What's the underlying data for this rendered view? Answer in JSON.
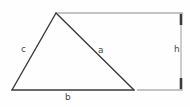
{
  "figure": {
    "background_color": "#fefefe",
    "stroke_color": "#3a3a3a",
    "dimension_color": "#6b6b6b",
    "label_color": "#4a4a4a",
    "labels": {
      "side_a": "a",
      "side_b": "b",
      "side_c": "c",
      "height": "h"
    },
    "geometry": {
      "apex": [
        56,
        13
      ],
      "bottom_left": [
        12,
        90
      ],
      "bottom_right": [
        134,
        90
      ],
      "dimension_line_x": 181,
      "dimension_top_y": 13,
      "dimension_bottom_y": 90,
      "extension_top": [
        56,
        13,
        182,
        13
      ],
      "extension_bottom": [
        134,
        90,
        183,
        90
      ]
    }
  }
}
